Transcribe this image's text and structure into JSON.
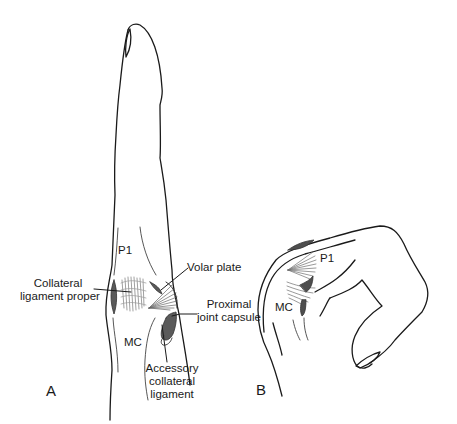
{
  "figure": {
    "panels": [
      {
        "id": "A",
        "letter": "A",
        "view": "dorsal view of extended finger with MCP joint ligaments",
        "labels": {
          "p1": "P1",
          "mc": "MC",
          "collateral_proper_1": "Collateral",
          "collateral_proper_2": "ligament proper",
          "volar_plate": "Volar plate",
          "proximal_capsule_1": "Proximal",
          "proximal_capsule_2": "joint capsule",
          "accessory_1": "Accessory",
          "accessory_2": "collateral",
          "accessory_3": "ligament"
        }
      },
      {
        "id": "B",
        "letter": "B",
        "view": "lateral view of flexed finger with MCP joint ligaments",
        "labels": {
          "p1": "P1",
          "mc": "MC"
        }
      }
    ],
    "colors": {
      "line": "#1a1a1a",
      "ligament_dark": "#555555",
      "ligament_fiber": "#7a7a7a",
      "background": "#ffffff"
    }
  }
}
